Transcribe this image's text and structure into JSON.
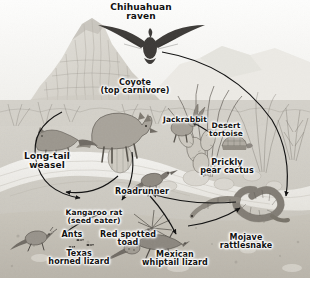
{
  "figure": {
    "type": "desert-food-web-illustration",
    "medium": "pencil / graphite shaded drawing of a Chihuahuan desert scene",
    "background_color": "#ffffff",
    "plate_tint": "#e9e7e2",
    "label_color": "#111111",
    "arrow_color": "#1a1a1a",
    "caption": ""
  },
  "labels": [
    {
      "id": "chihuahuan-raven",
      "line1": "Chihuahuan",
      "line2": "raven",
      "x": 141,
      "y": 3,
      "size": "l9",
      "role": "scavenger / top consumer",
      "organism": "bird"
    },
    {
      "id": "coyote",
      "line1": "Coyote",
      "line2": "(top carnivore)",
      "x": 135,
      "y": 79,
      "size": "l8",
      "role": "top carnivore",
      "organism": "mammal"
    },
    {
      "id": "jackrabbit",
      "line1": "Jackrabbit",
      "line2": "",
      "x": 185,
      "y": 116,
      "size": "l75",
      "role": "primary consumer",
      "organism": "mammal"
    },
    {
      "id": "desert-tortoise",
      "line1": "Desert",
      "line2": "tortoise",
      "x": 226,
      "y": 122,
      "size": "l75",
      "role": "herbivore",
      "organism": "reptile"
    },
    {
      "id": "long-tail-weasel",
      "line1": "Long-tail",
      "line2": "weasel",
      "x": 47,
      "y": 152,
      "size": "l9",
      "role": "carnivore",
      "organism": "mammal"
    },
    {
      "id": "prickly-pear-cactus",
      "line1": "Prickly",
      "line2": "pear cactus",
      "x": 227,
      "y": 159,
      "size": "l8",
      "role": "producer",
      "organism": "plant"
    },
    {
      "id": "roadrunner",
      "line1": "Roadrunner",
      "line2": "",
      "x": 142,
      "y": 188,
      "size": "l8",
      "role": "carnivore",
      "organism": "bird"
    },
    {
      "id": "kangaroo-rat",
      "line1": "Kangaroo rat",
      "line2": "(seed eater)",
      "x": 94,
      "y": 209,
      "size": "l75",
      "role": "seed eater / primary consumer",
      "organism": "mammal"
    },
    {
      "id": "ants",
      "line1": "Ants",
      "line2": "",
      "x": 72,
      "y": 231,
      "size": "l8",
      "role": "decomposer / primary consumer",
      "organism": "insect"
    },
    {
      "id": "red-spotted-toad",
      "line1": "Red spotted",
      "line2": "toad",
      "x": 128,
      "y": 231,
      "size": "l8",
      "role": "insectivore",
      "organism": "amphibian"
    },
    {
      "id": "texas-horned-lizard",
      "line1": "Texas",
      "line2": "horned lizard",
      "x": 79,
      "y": 250,
      "size": "l8",
      "role": "ant eater",
      "organism": "reptile"
    },
    {
      "id": "mexican-whiptail-lizard",
      "line1": "Mexican",
      "line2": "whiptail lizard",
      "x": 175,
      "y": 251,
      "size": "l8",
      "role": "insectivore",
      "organism": "reptile"
    },
    {
      "id": "mojave-rattlesnake",
      "line1": "Mojave",
      "line2": "rattlesnake",
      "x": 246,
      "y": 234,
      "size": "l8",
      "role": "carnivore",
      "organism": "reptile"
    }
  ],
  "scene_elements": {
    "butte": "eroded rock butte / mesa at upper left",
    "sky": "pale washed sky",
    "shrubs": "ocotillo and desert shrubs across the mid-ground",
    "wash": "pale sandy dry wash crossing the lower half",
    "ground": "gravelly desert floor in the foreground"
  },
  "arrows": {
    "count": 9,
    "style": "thin dark curved energy-flow arrows linking the organisms"
  }
}
